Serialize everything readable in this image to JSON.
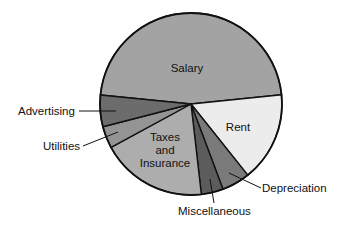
{
  "chart_data": {
    "type": "pie",
    "title": "",
    "categories": [
      "Salary",
      "Rent",
      "Depreciation",
      "Miscellaneous",
      "Taxes and Insurance",
      "Utilities",
      "Advertising"
    ],
    "values": [
      46.8,
      15.9,
      5.0,
      3.9,
      18.9,
      3.9,
      5.6
    ],
    "unit": "percent (estimated from slice angles)",
    "colors": [
      "#a3a3a3",
      "#ececec",
      "#7a7a7a",
      "#5c5c5c",
      "#adadad",
      "#949494",
      "#6c6c6c"
    ],
    "start_angle_deg": 185.7,
    "direction": "clockwise",
    "legend": "none (leader-line and in-slice labels)",
    "labels": {
      "salary": "Salary",
      "rent": "Rent",
      "depreciation": "Depreciation",
      "miscellaneous": "Miscellaneous",
      "taxes_line1": "Taxes",
      "taxes_line2": "and",
      "taxes_line3": "Insurance",
      "utilities": "Utilities",
      "advertising": "Advertising"
    }
  },
  "geometry": {
    "cx": 191,
    "cy": 104,
    "r": 91
  }
}
